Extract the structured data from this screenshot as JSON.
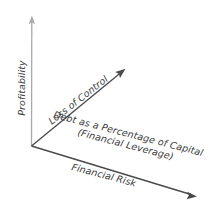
{
  "diagram": {
    "background_color": "#ffffff",
    "axes": {
      "vertical": {
        "label": "Profitability",
        "color": "#a9a9a9",
        "from": [
          31,
          146
        ],
        "to": [
          32,
          16
        ],
        "arrowhead": "up"
      },
      "diagonal_up": {
        "label": "Loss of Control",
        "color": "#4a4a4a",
        "from": [
          31,
          146
        ],
        "to": [
          124,
          70
        ],
        "arrowhead": "up-right"
      },
      "descending": {
        "label": "Financial Risk",
        "color": "#4a4a4a",
        "from": [
          31,
          146
        ],
        "to": [
          196,
          196
        ],
        "arrowhead": "down-right"
      }
    },
    "center_label": {
      "line1": "Debt as a Percentage of Capital",
      "line2": "(Financial Leverage)"
    },
    "text_color": "#3b3b3b"
  }
}
